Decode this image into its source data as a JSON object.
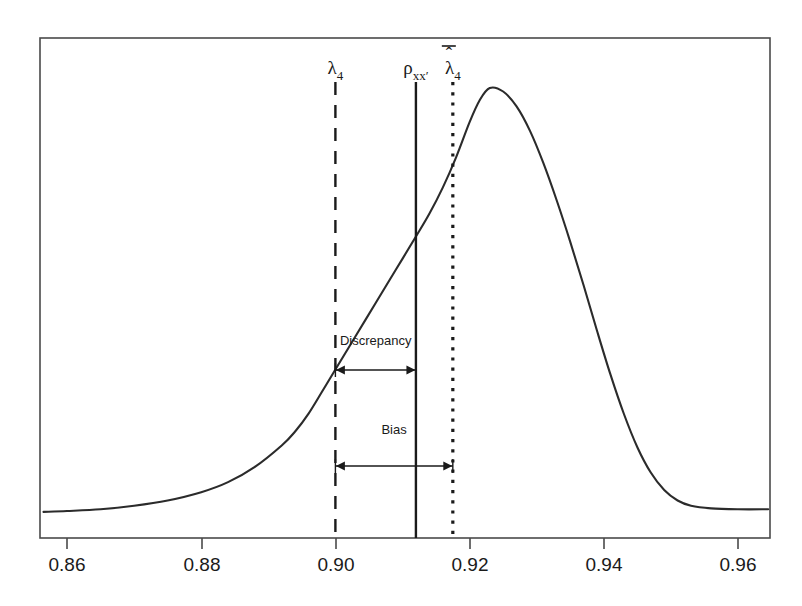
{
  "chart_data": {
    "type": "line",
    "title": "",
    "subtitle": "",
    "xlabel": "",
    "ylabel": "",
    "xlim": [
      0.856,
      0.965
    ],
    "ylim": [
      0,
      1
    ],
    "grid": false,
    "legend": null,
    "x_ticks": [
      {
        "value": 0.86,
        "label": "0.86",
        "px": 67
      },
      {
        "value": 0.88,
        "label": "0.88",
        "px": 202
      },
      {
        "value": 0.9,
        "label": "0.90",
        "px": 336
      },
      {
        "value": 0.92,
        "label": "0.92",
        "px": 470
      },
      {
        "value": 0.94,
        "label": "0.94",
        "px": 604
      },
      {
        "value": 0.96,
        "label": "0.96",
        "px": 738
      }
    ],
    "y_ticks": [],
    "series": [
      {
        "name": "sampling-distribution-density",
        "type": "line",
        "points": [
          {
            "x": 0.8565,
            "y": 0.03
          },
          {
            "x": 0.86,
            "y": 0.032
          },
          {
            "x": 0.865,
            "y": 0.036
          },
          {
            "x": 0.87,
            "y": 0.044
          },
          {
            "x": 0.875,
            "y": 0.056
          },
          {
            "x": 0.88,
            "y": 0.075
          },
          {
            "x": 0.884,
            "y": 0.098
          },
          {
            "x": 0.888,
            "y": 0.133
          },
          {
            "x": 0.892,
            "y": 0.182
          },
          {
            "x": 0.894,
            "y": 0.214
          },
          {
            "x": 0.896,
            "y": 0.255
          },
          {
            "x": 0.898,
            "y": 0.305
          },
          {
            "x": 0.9,
            "y": 0.356
          },
          {
            "x": 0.903,
            "y": 0.432
          },
          {
            "x": 0.906,
            "y": 0.508
          },
          {
            "x": 0.909,
            "y": 0.584
          },
          {
            "x": 0.912,
            "y": 0.66
          },
          {
            "x": 0.914,
            "y": 0.712
          },
          {
            "x": 0.916,
            "y": 0.772
          },
          {
            "x": 0.918,
            "y": 0.842
          },
          {
            "x": 0.92,
            "y": 0.922
          },
          {
            "x": 0.9215,
            "y": 0.972
          },
          {
            "x": 0.923,
            "y": 1.0
          },
          {
            "x": 0.925,
            "y": 0.992
          },
          {
            "x": 0.927,
            "y": 0.958
          },
          {
            "x": 0.929,
            "y": 0.902
          },
          {
            "x": 0.931,
            "y": 0.828
          },
          {
            "x": 0.933,
            "y": 0.742
          },
          {
            "x": 0.935,
            "y": 0.648
          },
          {
            "x": 0.937,
            "y": 0.548
          },
          {
            "x": 0.939,
            "y": 0.444
          },
          {
            "x": 0.941,
            "y": 0.344
          },
          {
            "x": 0.943,
            "y": 0.254
          },
          {
            "x": 0.945,
            "y": 0.178
          },
          {
            "x": 0.947,
            "y": 0.12
          },
          {
            "x": 0.949,
            "y": 0.08
          },
          {
            "x": 0.951,
            "y": 0.056
          },
          {
            "x": 0.953,
            "y": 0.044
          },
          {
            "x": 0.956,
            "y": 0.038
          },
          {
            "x": 0.96,
            "y": 0.036
          },
          {
            "x": 0.9645,
            "y": 0.036
          }
        ]
      }
    ],
    "reference_lines": [
      {
        "name": "lambda-4",
        "value": 0.9,
        "style": "dashed",
        "label": "λ",
        "label_sub": "4",
        "label_bar": false,
        "label_hat": false
      },
      {
        "name": "rho-xx-prime",
        "value": 0.912,
        "style": "solid",
        "label": "ρ",
        "label_sub": "xx′",
        "label_bar": false,
        "label_hat": false
      },
      {
        "name": "mean-lambda-hat-4",
        "value": 0.9175,
        "style": "dotted",
        "label": "λ",
        "label_sub": "4",
        "label_bar": true,
        "label_hat": true
      }
    ],
    "annotations": [
      {
        "name": "discrepancy",
        "label": "Discrepancy",
        "from": 0.9,
        "to": 0.912,
        "arrow": "double",
        "y_px": 370,
        "label_y_px": 345
      },
      {
        "name": "bias",
        "label": "Bias",
        "from": 0.9,
        "to": 0.9175,
        "arrow": "double",
        "y_px": 466,
        "label_y_px": 434
      }
    ],
    "colors": {
      "curve": "#2b2b2b",
      "frame": "#4a4a4a",
      "reference": "#1a1a1a",
      "text": "#1a1a1a",
      "background": "#ffffff"
    }
  }
}
